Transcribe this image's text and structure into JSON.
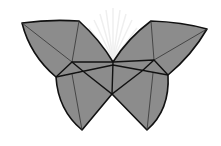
{
  "diagram": {
    "title": "Origami butterfly",
    "kind": "geometric polyhedral butterfly illustration",
    "colors": {
      "fill": "#8c8c8c",
      "outline": "#111111",
      "fold_lines": "#333333",
      "background": "#ffffff",
      "watermark": "#efefef"
    },
    "parts": [
      {
        "id": "upper-left-wing",
        "label": "Upper left wing"
      },
      {
        "id": "upper-right-wing",
        "label": "Upper right wing"
      },
      {
        "id": "lower-left-wing",
        "label": "Lower left wing"
      },
      {
        "id": "lower-right-wing",
        "label": "Lower right wing"
      },
      {
        "id": "body",
        "label": "Body"
      }
    ],
    "watermark": "faint fan/sunburst emblem behind the butterfly"
  }
}
